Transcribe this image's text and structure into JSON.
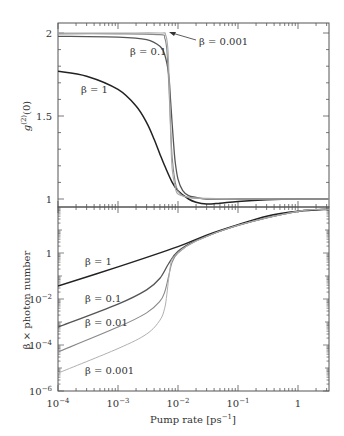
{
  "chart_data": [
    {
      "type": "line",
      "panel": "top",
      "title": "",
      "xlabel": "",
      "ylabel": "g (2)(0)",
      "xscale": "log",
      "xlim": [
        0.0001,
        3.3
      ],
      "ylim": [
        0.95,
        2.06
      ],
      "yticks": [
        1,
        1.5,
        2
      ],
      "ytick_labels": [
        "1",
        "1.5",
        "2"
      ],
      "grid": false,
      "series": [
        {
          "name": "β = 1",
          "color": "#222222",
          "x": [
            0.0001,
            0.0003,
            0.001,
            0.002,
            0.003,
            0.004,
            0.005,
            0.006,
            0.008,
            0.01,
            0.015,
            0.02,
            0.03,
            0.05,
            0.1,
            0.3,
            1,
            3.3
          ],
          "y": [
            1.77,
            1.74,
            1.66,
            1.56,
            1.46,
            1.36,
            1.27,
            1.2,
            1.1,
            1.05,
            1.0,
            0.98,
            0.97,
            0.975,
            0.985,
            0.995,
            1.0,
            1.0
          ]
        },
        {
          "name": "β = 0.1",
          "color": "#555555",
          "x": [
            0.0001,
            0.001,
            0.003,
            0.005,
            0.006,
            0.007,
            0.0075,
            0.008,
            0.0085,
            0.009,
            0.01,
            0.012,
            0.015,
            0.02,
            0.03,
            0.1,
            1,
            3.3
          ],
          "y": [
            1.98,
            1.975,
            1.96,
            1.92,
            1.87,
            1.75,
            1.6,
            1.45,
            1.32,
            1.22,
            1.12,
            1.05,
            1.02,
            1.01,
            1.0,
            1.0,
            1.0,
            1.0
          ]
        },
        {
          "name": "β = 0.01",
          "color": "#888888",
          "x": [
            0.0001,
            0.001,
            0.005,
            0.006,
            0.0065,
            0.007,
            0.0075,
            0.008,
            0.009,
            0.01,
            0.012,
            0.015,
            0.02,
            0.05,
            1,
            3.3
          ],
          "y": [
            1.995,
            1.995,
            1.99,
            1.97,
            1.9,
            1.7,
            1.45,
            1.25,
            1.1,
            1.05,
            1.02,
            1.01,
            1.005,
            1.0,
            1.0,
            1.0
          ]
        },
        {
          "name": "β = 0.001",
          "color": "#aaaaaa",
          "x": [
            0.0001,
            0.001,
            0.005,
            0.0062,
            0.0068,
            0.0072,
            0.0076,
            0.008,
            0.009,
            0.01,
            0.015,
            0.02,
            0.1,
            1,
            3.3
          ],
          "y": [
            2.0,
            2.0,
            2.0,
            1.99,
            1.9,
            1.65,
            1.35,
            1.18,
            1.07,
            1.03,
            1.01,
            1.005,
            1.0,
            1.0,
            1.0
          ]
        }
      ],
      "annotations": [
        {
          "text": "β = 0.001",
          "arrow": true
        },
        {
          "text": "β = 0.1"
        },
        {
          "text": "β = 1"
        }
      ]
    },
    {
      "type": "line",
      "panel": "bottom",
      "title": "",
      "xlabel": "Pump rate [ps⁻¹]",
      "ylabel": "β × photon number",
      "xscale": "log",
      "yscale": "log",
      "xlim": [
        0.0001,
        3.3
      ],
      "ylim": [
        1e-06,
        100
      ],
      "xticks": [
        0.0001,
        0.001,
        0.01,
        0.1,
        1
      ],
      "xtick_labels": [
        "10⁻⁴",
        "10⁻³",
        "10⁻²",
        "10⁻¹",
        "1"
      ],
      "yticks": [
        1e-06,
        0.0001,
        0.01,
        1
      ],
      "ytick_labels": [
        "10⁻⁶",
        "10⁻⁴",
        "10⁻²",
        "1"
      ],
      "grid": false,
      "series": [
        {
          "name": "β = 1",
          "color": "#222222",
          "x": [
            0.0001,
            0.001,
            0.01,
            0.03,
            0.1,
            0.3,
            1,
            3.3
          ],
          "y": [
            0.037,
            0.25,
            1.9,
            6.0,
            17,
            40,
            65,
            80
          ]
        },
        {
          "name": "β = 0.1",
          "color": "#555555",
          "x": [
            0.0001,
            0.001,
            0.003,
            0.005,
            0.007,
            0.01,
            0.02,
            0.1,
            1,
            3.3
          ],
          "y": [
            0.0006,
            0.006,
            0.025,
            0.08,
            0.35,
            1.2,
            3.5,
            16,
            65,
            80
          ]
        },
        {
          "name": "β = 0.01",
          "color": "#888888",
          "x": [
            0.0001,
            0.001,
            0.003,
            0.005,
            0.006,
            0.007,
            0.008,
            0.01,
            0.02,
            0.1,
            1,
            3.3
          ],
          "y": [
            5e-05,
            0.0006,
            0.0025,
            0.008,
            0.02,
            0.1,
            0.4,
            1.0,
            3.3,
            16,
            65,
            80
          ]
        },
        {
          "name": "β = 0.001",
          "color": "#b0b0b0",
          "x": [
            0.0001,
            0.001,
            0.003,
            0.005,
            0.006,
            0.0065,
            0.007,
            0.0075,
            0.008,
            0.01,
            0.02,
            0.1,
            1,
            3.3
          ],
          "y": [
            6e-06,
            7e-05,
            0.0003,
            0.0012,
            0.004,
            0.015,
            0.08,
            0.3,
            0.55,
            1.0,
            3.3,
            16,
            65,
            80
          ]
        }
      ],
      "annotations": [
        {
          "text": "β = 1"
        },
        {
          "text": "β = 0.1"
        },
        {
          "text": "β = 0.01"
        },
        {
          "text": "β = 0.001"
        }
      ]
    }
  ],
  "labels": {
    "top_ylabel_main": "g",
    "top_ylabel_sup": "(2)",
    "top_ylabel_tail": "(0)",
    "bottom_ylabel": "β × photon number",
    "xlabel_main": "Pump rate [ps",
    "xlabel_sup": "−1",
    "xlabel_tail": "]",
    "top_ann_b0001": "β = 0.001",
    "top_ann_b01": "β = 0.1",
    "top_ann_b1": "β = 1",
    "bot_ann_b1": "β = 1",
    "bot_ann_b01": "β = 0.1",
    "bot_ann_b001": "β = 0.01",
    "bot_ann_b0001": "β = 0.001",
    "top_ytick_2": "2",
    "top_ytick_15": "1.5",
    "top_ytick_1": "1",
    "bot_ytick_1": "1",
    "bot_ytick_m2_base": "10",
    "bot_ytick_m2_exp": "−2",
    "bot_ytick_m4_base": "10",
    "bot_ytick_m4_exp": "−4",
    "bot_ytick_m6_base": "10",
    "bot_ytick_m6_exp": "−6",
    "xtick_m4_base": "10",
    "xtick_m4_exp": "−4",
    "xtick_m3_base": "10",
    "xtick_m3_exp": "−3",
    "xtick_m2_base": "10",
    "xtick_m2_exp": "−2",
    "xtick_m1_base": "10",
    "xtick_m1_exp": "−1",
    "xtick_0": "1"
  }
}
